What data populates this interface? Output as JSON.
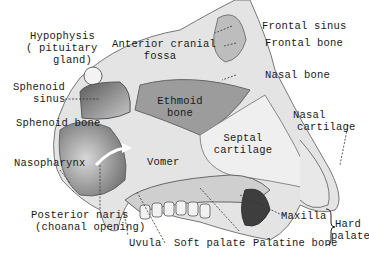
{
  "labels": {
    "hypophysis_1": "Hypophysis",
    "hypophysis_2": "( pituitary",
    "hypophysis_3": "gland)",
    "anterior_1": "Anterior cranial",
    "anterior_2": "fossa",
    "frontal_sinus": "Frontal sinus",
    "frontal_bone": "Frontal bone",
    "sphenoid_sinus_1": "Sphenoid",
    "sphenoid_sinus_2": "sinus",
    "nasal_bone": "Nasal bone",
    "ethmoid_1": "Ethmoid",
    "ethmoid_2": "bone",
    "nasal_cartilage_1": "Nasal",
    "nasal_cartilage_2": "cartilage",
    "sphenoid_bone": "Sphenoid bone",
    "septal_1": "Septal",
    "septal_2": "cartilage",
    "nasopharynx": "Nasopharynx",
    "vomer": "Vomer",
    "posterior_1": "Posterior naris",
    "posterior_2": "(choanal opening)",
    "maxilla": "Maxilla",
    "hard_palate_1": "Hard",
    "hard_palate_2": "palate",
    "uvula": "Uvula",
    "soft_palate": "Soft palate",
    "palatine_bone": "Palatine bone"
  },
  "colors": {
    "bone": "#e6e6e6",
    "cavity": "#9a9a9a",
    "dark": "#4a4a4a",
    "line": "#333333"
  }
}
